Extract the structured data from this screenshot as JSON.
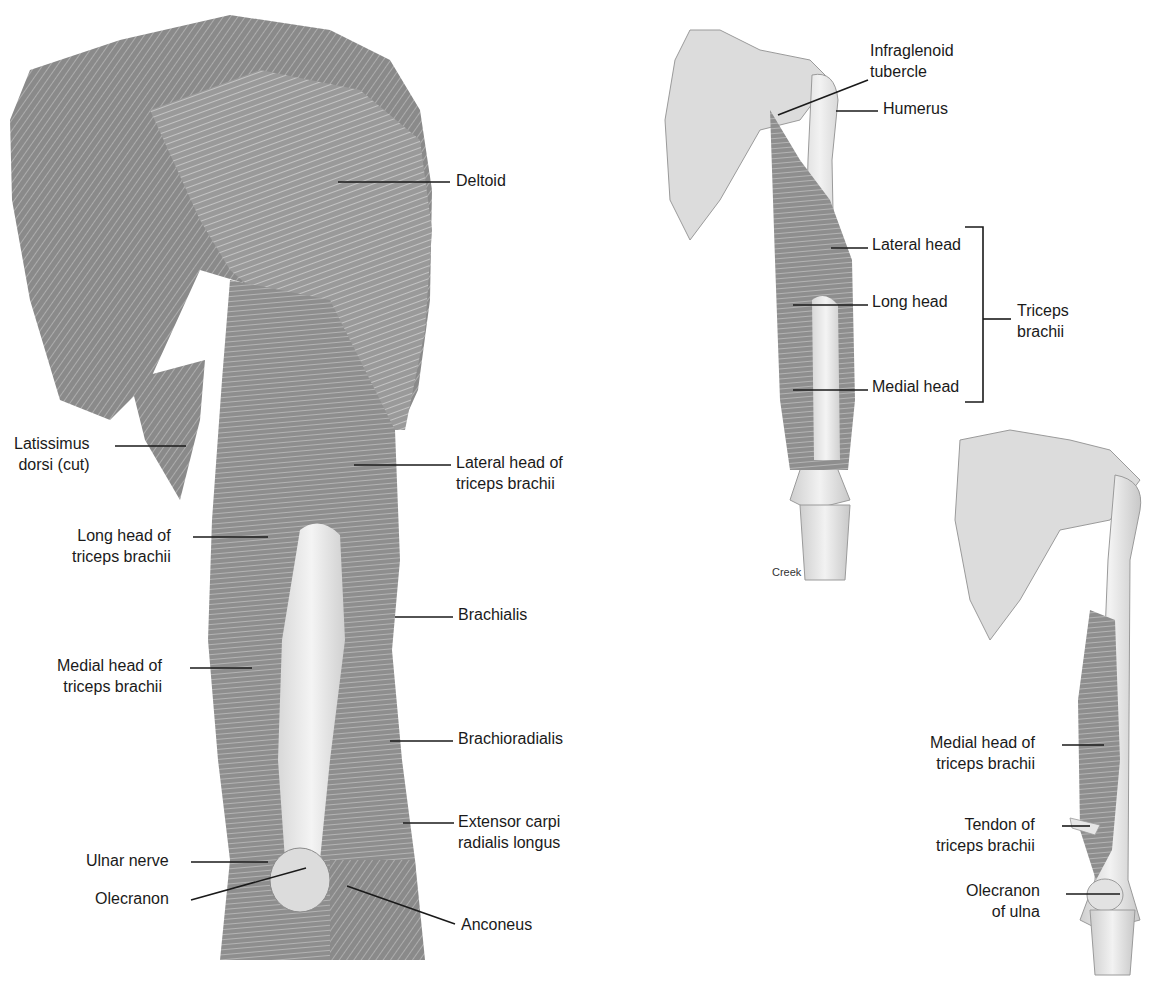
{
  "figure": {
    "panels": [
      {
        "id": "posterior-arm",
        "description": "Posterior view of right arm and shoulder muscles",
        "labels": [
          {
            "text": "Deltoid"
          },
          {
            "text": "Latissimus\ndorsi (cut)"
          },
          {
            "text": "Lateral head of\ntriceps brachii"
          },
          {
            "text": "Long head of\ntriceps brachii"
          },
          {
            "text": "Brachialis"
          },
          {
            "text": "Medial head of\ntriceps brachii"
          },
          {
            "text": "Brachioradialis"
          },
          {
            "text": "Extensor carpi\nradialis longus"
          },
          {
            "text": "Ulnar nerve"
          },
          {
            "text": "Olecranon"
          },
          {
            "text": "Anconeus"
          }
        ]
      },
      {
        "id": "triceps-isolated",
        "description": "Triceps brachii heads with scapula and humerus",
        "labels": [
          {
            "text": "Infraglenoid\ntubercle"
          },
          {
            "text": "Humerus"
          },
          {
            "text": "Lateral head"
          },
          {
            "text": "Long head"
          },
          {
            "text": "Medial head"
          },
          {
            "text": "Triceps\nbrachii"
          }
        ],
        "credit": "Creek"
      },
      {
        "id": "medial-head-deep",
        "description": "Deep view showing medial head of triceps",
        "labels": [
          {
            "text": "Medial head of\ntriceps brachii"
          },
          {
            "text": "Tendon of\ntriceps brachii"
          },
          {
            "text": "Olecranon\nof ulna"
          }
        ]
      }
    ]
  },
  "colors": {
    "muscle_dark": "#7a7a7a",
    "muscle_mid": "#9a9a9a",
    "muscle_light": "#c4c4c4",
    "bone": "#e6e6e6",
    "leader_line": "#1a1a1a"
  }
}
